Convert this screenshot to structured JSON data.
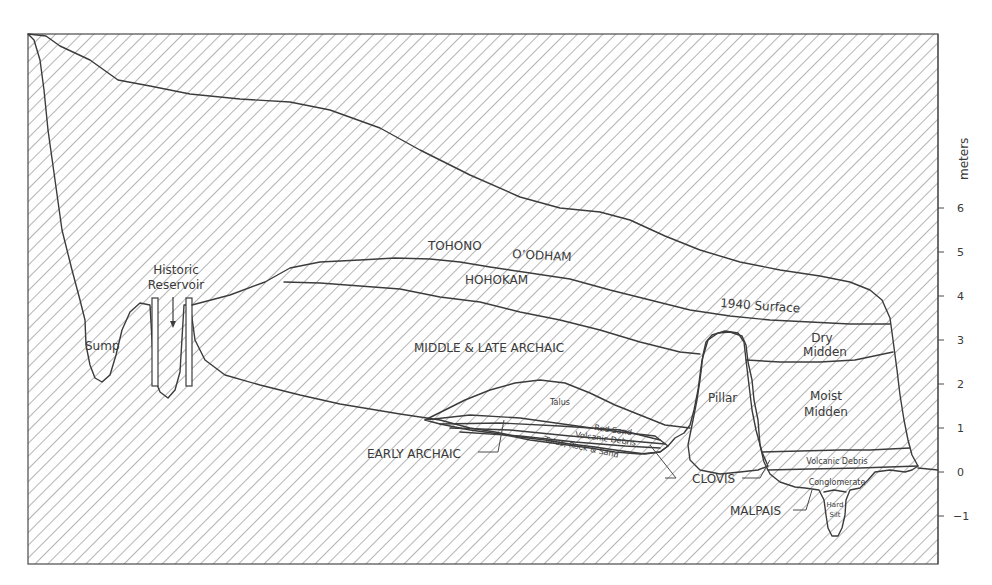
{
  "diagram": {
    "type": "stratigraphic-cross-section",
    "colors": {
      "ink": "#3c3c3c",
      "hatch": "#6a6a6a",
      "background": "#ffffff"
    },
    "scale": {
      "unit_label": "meters",
      "ticks": [
        "6",
        "5",
        "4",
        "3",
        "2",
        "1",
        "0",
        "−1"
      ]
    },
    "labels": {
      "historic_reservoir_1": "Historic",
      "historic_reservoir_2": "Reservoir",
      "sump": "Sump",
      "tohono": "TOHONO",
      "oodham": "O’ODHAM",
      "hohokam": "HOHOKAM",
      "middle_late_archaic": "MIDDLE & LATE ARCHAIC",
      "surface_1940": "1940 Surface",
      "dry_midden_1": "Dry",
      "dry_midden_2": "Midden",
      "moist_midden_1": "Moist",
      "moist_midden_2": "Midden",
      "pillar": "Pillar",
      "talus": "Talus",
      "red_sand": "Red Sand",
      "volcanic_debris_left": "Volcanic Debris",
      "talus_rock_sand": "Talus, Rock & Sand",
      "early_archaic": "EARLY ARCHAIC",
      "clovis": "CLOVIS",
      "malpais": "MALPAIS",
      "volcanic_debris_right": "Volcanic Debris",
      "conglomerate": "Conglomerate",
      "hard_silt_1": "Hard",
      "hard_silt_2": "Silt"
    }
  }
}
